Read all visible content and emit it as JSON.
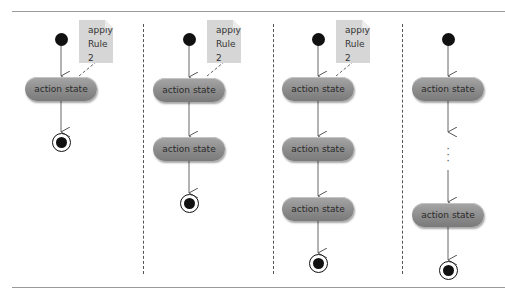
{
  "diagram": {
    "type": "UML activity diagram sequence",
    "colors": {
      "action_fill": "#8e8e8e",
      "note_fill": "#d6d6d6",
      "line": "#666666",
      "node": "#111111"
    },
    "note_text": [
      "apply",
      "Rule 2"
    ],
    "columns": [
      {
        "id": "col1",
        "note": {
          "line1": "apply",
          "line2": "Rule 2"
        },
        "states": [
          {
            "label": "action state"
          }
        ]
      },
      {
        "id": "col2",
        "note": {
          "line1": "apply",
          "line2": "Rule 2"
        },
        "states": [
          {
            "label": "action state"
          },
          {
            "label": "action state"
          }
        ]
      },
      {
        "id": "col3",
        "note": {
          "line1": "apply",
          "line2": "Rule 2"
        },
        "states": [
          {
            "label": "action state"
          },
          {
            "label": "action state"
          },
          {
            "label": "action state"
          }
        ]
      },
      {
        "id": "col4",
        "ellipsis": "⋮",
        "states": [
          {
            "label": "action state"
          },
          {
            "label": "action state"
          }
        ]
      }
    ]
  }
}
